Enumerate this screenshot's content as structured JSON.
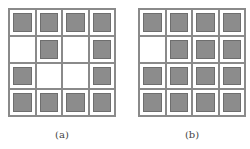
{
  "panels": [
    {
      "label": "(a)",
      "grid": [
        [
          1,
          1,
          1,
          1
        ],
        [
          0,
          1,
          0,
          1
        ],
        [
          1,
          0,
          0,
          1
        ],
        [
          1,
          1,
          1,
          1
        ]
      ]
    },
    {
      "label": "(b)",
      "grid": [
        [
          1,
          1,
          1,
          1
        ],
        [
          0,
          1,
          1,
          1
        ],
        [
          1,
          1,
          1,
          1
        ],
        [
          1,
          1,
          1,
          1
        ]
      ]
    }
  ],
  "colors": {
    "filled": "#8c8c8c",
    "empty": "#ffffff",
    "line": "#8a8a8a"
  }
}
